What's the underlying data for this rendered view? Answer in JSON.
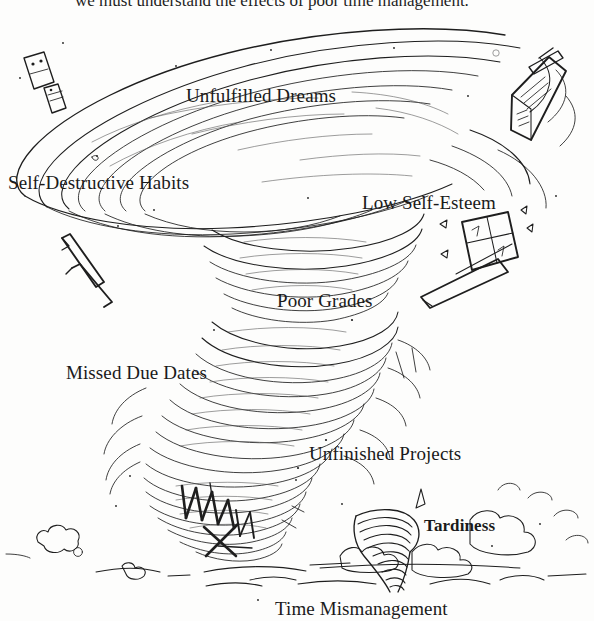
{
  "figure": {
    "title_cut_off_top": "we must understand the effects of poor time management.",
    "caption": "Time Mismanagement",
    "ink_color": "#1a1a1a",
    "background_color": "#fdfdfc"
  },
  "labels": [
    {
      "id": "unfulfilled-dreams",
      "text": "Unfulfilled Dreams"
    },
    {
      "id": "self-destructive",
      "text": "Self-Destructive Habits"
    },
    {
      "id": "low-self-esteem",
      "text": "Low Self-Esteem"
    },
    {
      "id": "poor-grades",
      "text": "Poor Grades"
    },
    {
      "id": "missed-due-dates",
      "text": "Missed Due Dates"
    },
    {
      "id": "unfinished-projects",
      "text": "Unfinished Projects"
    },
    {
      "id": "tardiness",
      "text": "Tardiness"
    }
  ],
  "caption": {
    "text": "Time Mismanagement"
  }
}
